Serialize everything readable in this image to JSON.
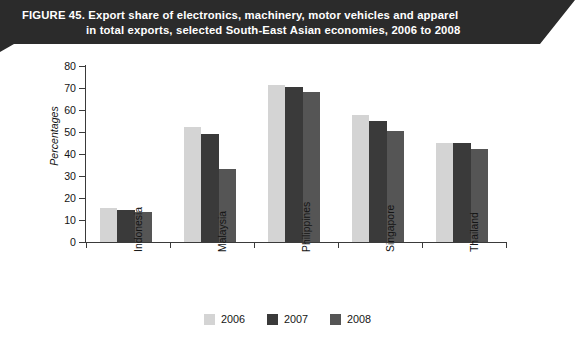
{
  "figure": {
    "banner_color": "#2b2b2b",
    "title_line_1": "FIGURE 45.  Export share of electronics, machinery, motor vehicles and apparel",
    "title_line_2": "in total exports, selected South-East Asian economies, 2006 to 2008"
  },
  "chart_data": {
    "type": "bar",
    "title": "Export share of electronics, machinery, motor vehicles and apparel in total exports, selected South-East Asian economies, 2006 to 2008",
    "xlabel": "",
    "ylabel": "Percentages",
    "ylim": [
      0,
      80
    ],
    "ytick_step": 10,
    "yticks": [
      "80",
      "70",
      "60",
      "50",
      "40",
      "30",
      "20",
      "10",
      "0"
    ],
    "grid": false,
    "legend_position": "bottom-center",
    "categories": [
      "Indonesia",
      "Malaysia",
      "Philippines",
      "Singapore",
      "Thailand"
    ],
    "series": [
      {
        "name": "2006",
        "color": "#d4d4d4",
        "values": [
          15.3,
          52.5,
          71.5,
          57.8,
          45.0
        ]
      },
      {
        "name": "2007",
        "color": "#3a3a3a",
        "values": [
          14.5,
          49.0,
          70.5,
          55.0,
          44.8
        ]
      },
      {
        "name": "2008",
        "color": "#555555",
        "values": [
          13.8,
          33.0,
          68.0,
          50.5,
          42.2
        ]
      }
    ]
  }
}
